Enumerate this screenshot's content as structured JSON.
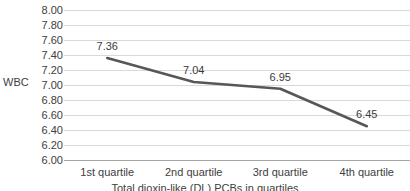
{
  "chart_data": {
    "type": "line",
    "title": "",
    "categories": [
      "1st quartile",
      "2nd quartile",
      "3rd quartile",
      "4th quartile"
    ],
    "values": [
      7.36,
      7.04,
      6.95,
      6.45
    ],
    "data_labels": [
      "7.36",
      "7.04",
      "6.95",
      "6.45"
    ],
    "series": [
      {
        "name": "WBC",
        "values": [
          7.36,
          7.04,
          6.95,
          6.45
        ]
      }
    ],
    "xlabel": "Total dioxin-like (DL) PCBs in quartiles",
    "ylabel": "WBC",
    "ylim": [
      6.0,
      8.0
    ],
    "ytick_step": 0.2,
    "ytick_labels": [
      "8.00",
      "7.80",
      "7.60",
      "7.40",
      "7.20",
      "7.00",
      "6.80",
      "6.60",
      "6.40",
      "6.20",
      "6.00"
    ],
    "ytick_values": [
      8.0,
      7.8,
      7.6,
      7.4,
      7.2,
      7.0,
      6.8,
      6.6,
      6.4,
      6.2,
      6.0
    ],
    "grid": true,
    "grid_axis": "y",
    "legend": false,
    "legend_position": "none",
    "colors": {
      "series_line": "#575757",
      "gridline": "#d9d9d9",
      "axis": "#a6a6a6",
      "text": "#404040",
      "background": "#ffffff"
    }
  }
}
